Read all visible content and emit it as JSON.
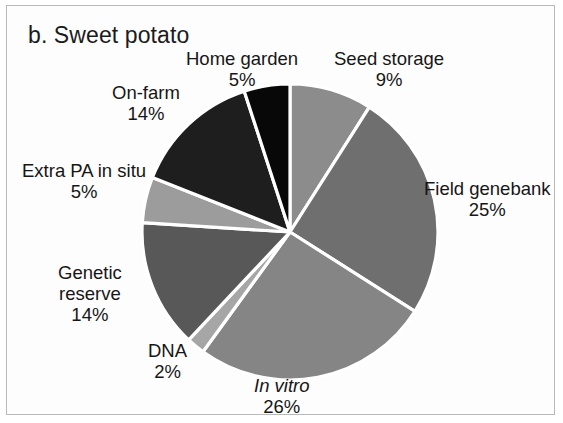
{
  "figure": {
    "title": "b. Sweet potato",
    "background_color": "#ffffff",
    "border_color": "#b9b9b9",
    "separator_color": "#ffffff"
  },
  "chart_data": {
    "type": "pie",
    "title": "b. Sweet potato",
    "xlabel": "",
    "ylabel": "",
    "legend_position": "none",
    "grid": false,
    "units": "percent",
    "start_angle_deg": 0,
    "direction": "clockwise",
    "total": 100,
    "categories": [
      "Seed storage",
      "Field genebank",
      "In vitro",
      "DNA",
      "Genetic reserve",
      "Extra PA in situ",
      "On-farm",
      "Home garden"
    ],
    "values": [
      9,
      25,
      26,
      2,
      14,
      5,
      14,
      5
    ],
    "slices": [
      {
        "name": "Seed storage",
        "value": 9,
        "pct_label": "9%",
        "color": "#8c8c8c",
        "italic_name": false
      },
      {
        "name": "Field genebank",
        "value": 25,
        "pct_label": "25%",
        "color": "#6f6f6f",
        "italic_name": false
      },
      {
        "name": "In vitro",
        "value": 26,
        "pct_label": "26%",
        "color": "#858585",
        "italic_name": true
      },
      {
        "name": "DNA",
        "value": 2,
        "pct_label": "2%",
        "color": "#a6a6a6",
        "italic_name": false
      },
      {
        "name": "Genetic reserve",
        "value": 14,
        "pct_label": "14%",
        "color": "#585858",
        "italic_name": false
      },
      {
        "name": "Extra PA in situ",
        "value": 5,
        "pct_label": "5%",
        "color": "#9c9c9c",
        "italic_name": false
      },
      {
        "name": "On-farm",
        "value": 14,
        "pct_label": "14%",
        "color": "#1e1e1e",
        "italic_name": false
      },
      {
        "name": "Home garden",
        "value": 5,
        "pct_label": "5%",
        "color": "#080808",
        "italic_name": false
      }
    ]
  },
  "labels": {
    "seed_storage": {
      "name": "Seed storage",
      "pct": "9%"
    },
    "field_genebank": {
      "name": "Field genebank",
      "pct": "25%"
    },
    "in_vitro": {
      "name": "In vitro",
      "pct": "26%"
    },
    "dna": {
      "name": "DNA",
      "pct": "2%"
    },
    "genetic_reserve": {
      "name_line1": "Genetic",
      "name_line2": "reserve",
      "pct": "14%"
    },
    "extra_pa_in_situ": {
      "name": "Extra PA in situ",
      "pct": "5%"
    },
    "on_farm": {
      "name": "On-farm",
      "pct": "14%"
    },
    "home_garden": {
      "name": "Home garden",
      "pct": "5%"
    }
  }
}
